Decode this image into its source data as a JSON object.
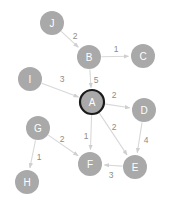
{
  "graph": {
    "title": "Weighted Directed Graph",
    "background_color": "#ffffff",
    "node_color": "#a9a9a9",
    "node_label_color": "#ffffff",
    "edge_color": "#d8d8d8",
    "edge_label_color": "#8c8c8c",
    "highlight_color": "#1a1a1a",
    "node_radius": 12,
    "nodes": [
      {
        "id": "A",
        "label": "A",
        "x": 92,
        "y": 102,
        "highlighted": true
      },
      {
        "id": "B",
        "label": "B",
        "x": 89,
        "y": 57,
        "highlighted": false
      },
      {
        "id": "C",
        "label": "C",
        "x": 143,
        "y": 56,
        "highlighted": false
      },
      {
        "id": "D",
        "label": "D",
        "x": 144,
        "y": 110,
        "highlighted": false
      },
      {
        "id": "E",
        "label": "E",
        "x": 135,
        "y": 167,
        "highlighted": false
      },
      {
        "id": "F",
        "label": "F",
        "x": 90,
        "y": 164,
        "highlighted": false
      },
      {
        "id": "G",
        "label": "G",
        "x": 38,
        "y": 128,
        "highlighted": false
      },
      {
        "id": "H",
        "label": "H",
        "x": 27,
        "y": 182,
        "highlighted": false
      },
      {
        "id": "I",
        "label": "I",
        "x": 30,
        "y": 79,
        "highlighted": false
      },
      {
        "id": "J",
        "label": "J",
        "x": 52,
        "y": 23,
        "highlighted": false
      }
    ],
    "edges": [
      {
        "from": "J",
        "to": "B",
        "weight": "2",
        "lx": 75,
        "ly": 36
      },
      {
        "from": "B",
        "to": "C",
        "weight": "1",
        "lx": 116,
        "ly": 49
      },
      {
        "from": "B",
        "to": "A",
        "weight": "5",
        "lx": 96,
        "ly": 80
      },
      {
        "from": "I",
        "to": "A",
        "weight": "3",
        "lx": 62,
        "ly": 79
      },
      {
        "from": "A",
        "to": "D",
        "weight": "2",
        "lx": 114,
        "ly": 95
      },
      {
        "from": "A",
        "to": "E",
        "weight": "2",
        "lx": 114,
        "ly": 127
      },
      {
        "from": "A",
        "to": "F",
        "weight": "1",
        "lx": 86,
        "ly": 136
      },
      {
        "from": "D",
        "to": "E",
        "weight": "4",
        "lx": 146,
        "ly": 140
      },
      {
        "from": "E",
        "to": "F",
        "weight": "3",
        "lx": 111,
        "ly": 175
      },
      {
        "from": "G",
        "to": "F",
        "weight": "2",
        "lx": 62,
        "ly": 139
      },
      {
        "from": "G",
        "to": "H",
        "weight": "1",
        "lx": 39,
        "ly": 157
      }
    ]
  }
}
